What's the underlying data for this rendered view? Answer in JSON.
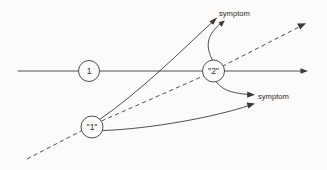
{
  "diagram": {
    "background_color": "#fcfbfa",
    "stroke_color": "#3b3a38",
    "nodes": [
      {
        "id": "node-1-plain",
        "label": "1",
        "cx": 89,
        "cy": 71,
        "r": 10.5
      },
      {
        "id": "node-2-quoted",
        "label": "\"2\"",
        "cx": 213.5,
        "cy": 71,
        "r": 11
      },
      {
        "id": "node-1-quoted",
        "label": "\"1\"",
        "cx": 92,
        "cy": 127,
        "r": 11
      }
    ],
    "annotations": [
      {
        "id": "symptom-upper",
        "label": "symptom",
        "x": 219,
        "y": 16
      },
      {
        "id": "symptom-lower",
        "label": "symptom",
        "x": 258,
        "y": 99
      }
    ],
    "edges": [
      {
        "id": "main-horizontal-axis",
        "style": "solid",
        "arrow": true
      },
      {
        "id": "dashed-diagonal-axis",
        "style": "dashed",
        "arrow": true
      },
      {
        "id": "edge-node1q-to-symptom-upper",
        "style": "solid",
        "arrow": true
      },
      {
        "id": "edge-node2q-to-symptom-upper",
        "style": "curve",
        "arrow": true
      },
      {
        "id": "edge-node2q-to-symptom-lower",
        "style": "curve",
        "arrow": true
      },
      {
        "id": "edge-node1q-to-symptom-lower",
        "style": "curve",
        "arrow": true
      }
    ]
  }
}
